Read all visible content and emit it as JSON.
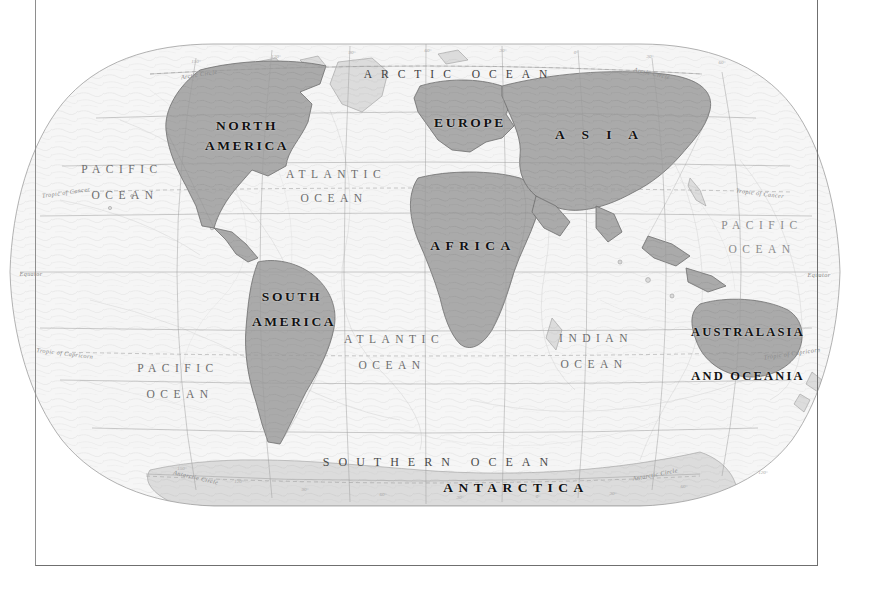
{
  "document": {
    "kind": "world-map-plate",
    "projection": "Robinson-like pseudocylindrical",
    "background_color": "#ffffff",
    "frame_color": "#6f6f6f",
    "land_fill_highlight": "#a9a9a9",
    "land_fill_plain": "#d9d9d9",
    "ocean_fill": "#f4f4f4",
    "graticule_color": "#9a9a9a"
  },
  "continents": [
    {
      "id": "north-america",
      "lines": [
        "NORTH",
        "AMERICA"
      ],
      "x": 247,
      "y": 126,
      "line_gap": 20
    },
    {
      "id": "south-america",
      "lines": [
        "SOUTH",
        "AMERICA"
      ],
      "x": 292,
      "y": 297,
      "line_gap": 22
    },
    {
      "id": "europe",
      "label": "EUROPE",
      "x": 470,
      "y": 123
    },
    {
      "id": "asia",
      "label": "A  S  I  A",
      "x": 600,
      "y": 135
    },
    {
      "id": "africa",
      "label": "AFRICA",
      "x": 473,
      "y": 246
    },
    {
      "id": "australasia",
      "lines": [
        "AUSTRALASIA",
        "AND OCEANIA"
      ],
      "x": 748,
      "y": 332,
      "line_gap": 44
    },
    {
      "id": "antarctica",
      "label": "ANTARCTICA",
      "x": 516,
      "y": 488
    }
  ],
  "oceans": [
    {
      "id": "arctic-ocean",
      "label": "ARCTIC OCEAN",
      "x": 460,
      "y": 74
    },
    {
      "id": "pacific-ocean-nw",
      "lines": [
        "PACIFIC",
        "OCEAN"
      ],
      "x": 122,
      "y": 169,
      "line_gap": 26
    },
    {
      "id": "pacific-ocean-sw",
      "lines": [
        "PACIFIC",
        "OCEAN"
      ],
      "x": 178,
      "y": 368,
      "line_gap": 26
    },
    {
      "id": "pacific-ocean-e",
      "lines": [
        "PACIFIC",
        "OCEAN"
      ],
      "x": 762,
      "y": 225,
      "line_gap": 24
    },
    {
      "id": "atlantic-ocean-n",
      "lines": [
        "ATLANTIC",
        "OCEAN"
      ],
      "x": 336,
      "y": 174,
      "line_gap": 24
    },
    {
      "id": "atlantic-ocean-s",
      "lines": [
        "ATLANTIC",
        "OCEAN"
      ],
      "x": 394,
      "y": 339,
      "line_gap": 26
    },
    {
      "id": "indian-ocean",
      "lines": [
        "INDIAN",
        "OCEAN"
      ],
      "x": 596,
      "y": 338,
      "line_gap": 26
    },
    {
      "id": "southern-ocean",
      "label": "SOUTHERN  OCEAN",
      "x": 440,
      "y": 462
    }
  ],
  "latitude_lines": [
    {
      "id": "arctic-circle-left",
      "label": "Arctic Circle",
      "x": 199,
      "y": 74,
      "rotate": -9
    },
    {
      "id": "arctic-circle-right",
      "label": "Arctic Circle",
      "x": 652,
      "y": 73,
      "rotate": 13
    },
    {
      "id": "tropic-of-cancer-left",
      "label": "Tropic of Cancer",
      "x": 66,
      "y": 192,
      "rotate": -8
    },
    {
      "id": "tropic-of-cancer-right",
      "label": "Tropic of Cancer",
      "x": 760,
      "y": 193,
      "rotate": 7
    },
    {
      "id": "equator-left",
      "label": "Equator",
      "x": 31,
      "y": 273,
      "rotate": 0
    },
    {
      "id": "equator-right",
      "label": "Equator",
      "x": 819,
      "y": 274,
      "rotate": 0
    },
    {
      "id": "tropic-of-capricorn-left",
      "label": "Tropic of Capricorn",
      "x": 65,
      "y": 353,
      "rotate": 7
    },
    {
      "id": "tropic-of-capricorn-right",
      "label": "Tropic of Capricorn",
      "x": 792,
      "y": 353,
      "rotate": -8
    },
    {
      "id": "antarctic-circle-left",
      "label": "Antarctic Circle",
      "x": 196,
      "y": 477,
      "rotate": 13
    },
    {
      "id": "antarctic-circle-right",
      "label": "Antarctic Circle",
      "x": 655,
      "y": 474,
      "rotate": -11
    }
  ],
  "graticule": {
    "parallels_deg": [
      75,
      60,
      45,
      30,
      15,
      0,
      -15,
      -30,
      -45,
      -60,
      -75
    ],
    "meridians_deg": [
      -180,
      -150,
      -120,
      -90,
      -60,
      -30,
      0,
      30,
      60,
      90,
      120,
      150,
      180
    ],
    "meridian_tick_labels": [
      "180°",
      "150°",
      "120°",
      "90°",
      "60°",
      "30°",
      "0°",
      "30°",
      "60°",
      "90°",
      "120°",
      "150°",
      "180°"
    ],
    "visible": true
  },
  "minor_labels": [
    {
      "id": "tick-top-1",
      "label": "150°",
      "x": 196,
      "y": 61
    },
    {
      "id": "tick-top-2",
      "label": "120°",
      "x": 276,
      "y": 56
    },
    {
      "id": "tick-top-3",
      "label": "90°",
      "x": 352,
      "y": 52
    },
    {
      "id": "tick-top-4",
      "label": "60°",
      "x": 428,
      "y": 50
    },
    {
      "id": "tick-top-5",
      "label": "30°",
      "x": 503,
      "y": 50
    },
    {
      "id": "tick-top-6",
      "label": "0°",
      "x": 576,
      "y": 52
    },
    {
      "id": "tick-top-7",
      "label": "30°",
      "x": 650,
      "y": 56
    },
    {
      "id": "tick-top-8",
      "label": "60°",
      "x": 722,
      "y": 62
    },
    {
      "id": "tick-bot-1",
      "label": "150°",
      "x": 182,
      "y": 468
    },
    {
      "id": "tick-bot-2",
      "label": "120°",
      "x": 239,
      "y": 481
    },
    {
      "id": "tick-bot-3",
      "label": "90°",
      "x": 305,
      "y": 489
    },
    {
      "id": "tick-bot-4",
      "label": "60°",
      "x": 383,
      "y": 494
    },
    {
      "id": "tick-bot-5",
      "label": "30°",
      "x": 460,
      "y": 497
    },
    {
      "id": "tick-bot-6",
      "label": "0°",
      "x": 538,
      "y": 496
    },
    {
      "id": "tick-bot-7",
      "label": "30°",
      "x": 613,
      "y": 493
    },
    {
      "id": "tick-bot-8",
      "label": "60°",
      "x": 684,
      "y": 486
    },
    {
      "id": "tick-bot-9",
      "label": "120°",
      "x": 763,
      "y": 472
    }
  ]
}
